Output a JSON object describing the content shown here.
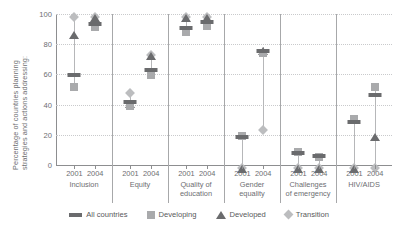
{
  "chart_data": {
    "type": "scatter",
    "title": "",
    "xlabel": "",
    "ylabel_line1": "Percentage of countries planning",
    "ylabel_line2": "strategies and actions addressing:",
    "ylim": [
      0,
      100
    ],
    "yticks": [
      0,
      20,
      40,
      60,
      80,
      100
    ],
    "grid": true,
    "legend_position": "bottom",
    "categories": [
      "Inclusion",
      "Equity",
      "Quality of education",
      "Gender equality",
      "Challenges of emergency",
      "HIV/AIDS"
    ],
    "category_lines": [
      [
        "Inclusion"
      ],
      [
        "Equity"
      ],
      [
        "Quality of",
        "education"
      ],
      [
        "Gender",
        "equality"
      ],
      [
        "Challenges",
        "of emergency"
      ],
      [
        "HIV/AIDS"
      ]
    ],
    "years": [
      "2001",
      "2004"
    ],
    "series": [
      {
        "name": "All countries",
        "marker": "bar",
        "color": "#6a6b6d"
      },
      {
        "name": "Developing",
        "marker": "square",
        "color": "#a9aaac"
      },
      {
        "name": "Developed",
        "marker": "triangle",
        "color": "#6a6b6d"
      },
      {
        "name": "Transition",
        "marker": "diamond",
        "color": "#bcbdbf"
      }
    ],
    "points": [
      {
        "category": "Inclusion",
        "year": "2001",
        "all_countries": 61,
        "developing": 54,
        "developed": 89,
        "transition": 100
      },
      {
        "category": "Inclusion",
        "year": "2004",
        "all_countries": 95,
        "developing": 94,
        "developed": 100,
        "transition": 100
      },
      {
        "category": "Equity",
        "year": "2001",
        "all_countries": 43,
        "developing": 42,
        "developed": 43,
        "transition": 50
      },
      {
        "category": "Equity",
        "year": "2004",
        "all_countries": 64,
        "developing": 62,
        "developed": 75,
        "transition": 75
      },
      {
        "category": "Quality of education",
        "year": "2001",
        "all_countries": 92,
        "developing": 91,
        "developed": 100,
        "transition": 100
      },
      {
        "category": "Quality of education",
        "year": "2004",
        "all_countries": 96,
        "developing": 95,
        "developed": 100,
        "transition": 100
      },
      {
        "category": "Gender equality",
        "year": "2001",
        "all_countries": 20,
        "developing": 22,
        "developed": 0,
        "transition": 0
      },
      {
        "category": "Gender equality",
        "year": "2004",
        "all_countries": 77,
        "developing": 77,
        "developed": 78,
        "transition": 25
      },
      {
        "category": "Challenges of emergency",
        "year": "2001",
        "all_countries": 9,
        "developing": 11,
        "developed": 0,
        "transition": 0
      },
      {
        "category": "Challenges of emergency",
        "year": "2004",
        "all_countries": 7,
        "developing": 8,
        "developed": 0,
        "transition": 0
      },
      {
        "category": "HIV/AIDS",
        "year": "2001",
        "all_countries": 30,
        "developing": 33,
        "developed": 0,
        "transition": 0
      },
      {
        "category": "HIV/AIDS",
        "year": "2004",
        "all_countries": 48,
        "developing": 54,
        "developed": 21,
        "transition": 0
      }
    ]
  },
  "legend": {
    "items": [
      {
        "label": "All countries",
        "icon": "bar-marker-icon"
      },
      {
        "label": "Developing",
        "icon": "square-marker-icon"
      },
      {
        "label": "Developed",
        "icon": "triangle-marker-icon"
      },
      {
        "label": "Transition",
        "icon": "diamond-marker-icon"
      }
    ]
  }
}
